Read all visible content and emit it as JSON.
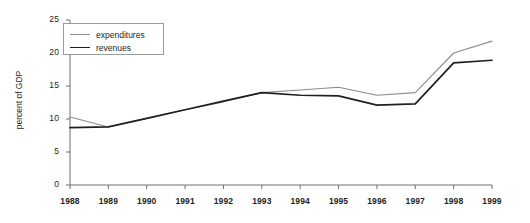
{
  "chart_data": {
    "type": "line",
    "title": "",
    "xlabel": "",
    "ylabel": "percent of GDP",
    "xlim": [
      1988,
      1999
    ],
    "ylim": [
      0,
      25
    ],
    "yticks": [
      0,
      5,
      10,
      15,
      20,
      25
    ],
    "grid": false,
    "legend_position": "top-left",
    "categories": [
      1988,
      1989,
      1990,
      1991,
      1992,
      1993,
      1994,
      1995,
      1996,
      1997,
      1998,
      1999
    ],
    "x": [
      "1988",
      "1989",
      "1990",
      "1991",
      "1992",
      "1993",
      "1994",
      "1995",
      "1996",
      "1997",
      "1998",
      "1999"
    ],
    "series": [
      {
        "name": "expenditures",
        "color": "#8c8c8c",
        "values": [
          10.3,
          8.8,
          10.1,
          11.4,
          12.6,
          14.0,
          14.4,
          14.8,
          13.6,
          14.0,
          20.0,
          21.8
        ]
      },
      {
        "name": "revenues",
        "color": "#231f20",
        "values": [
          8.7,
          8.8,
          10.1,
          11.4,
          12.7,
          14.0,
          13.6,
          13.5,
          12.1,
          12.3,
          18.5,
          18.9
        ]
      }
    ]
  },
  "axis": {
    "y_label": "percent of GDP",
    "y_tick_labels": [
      "0",
      "5",
      "10",
      "15",
      "20",
      "25"
    ],
    "x_tick_labels": [
      "1988",
      "1989",
      "1990",
      "1991",
      "1992",
      "1993",
      "1994",
      "1995",
      "1996",
      "1997",
      "1998",
      "1999"
    ]
  },
  "legend": {
    "entries": [
      {
        "label": "expenditures",
        "color": "#8c8c8c"
      },
      {
        "label": "revenues",
        "color": "#231f20"
      }
    ]
  },
  "colors": {
    "axis": "#6f6f6f",
    "text": "#231f20",
    "expenditures": "#8c8c8c",
    "revenues": "#231f20",
    "legend_border": "#9a9a9a",
    "background": "#ffffff"
  }
}
